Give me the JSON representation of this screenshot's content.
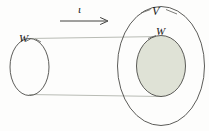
{
  "figure": {
    "type": "set-map-diagram",
    "background_color": "#fdfdfc",
    "stroke_color": "#4a4a46",
    "guide_line_color": "#b9bcb5",
    "fill_color": "#dfe2d6",
    "labels": {
      "source_set": "W",
      "target_superset": "V",
      "target_subset": "W",
      "map_arrow": "ι"
    },
    "elements": [
      {
        "name": "source-oval",
        "label": "W",
        "filled": false,
        "cx": 29.5,
        "cy": 67,
        "rx": 19.5,
        "ry": 28.5
      },
      {
        "name": "target-outer-oval",
        "label": "V",
        "filled": false,
        "cx": 161,
        "cy": 66,
        "rx": 44,
        "ry": 60
      },
      {
        "name": "target-inner-oval",
        "label": "W",
        "filled": true,
        "cx": 161,
        "cy": 66,
        "rx": 25,
        "ry": 31
      },
      {
        "name": "guide-line-top",
        "x1": 30,
        "y1": 38,
        "x2": 161,
        "y2": 36
      },
      {
        "name": "guide-line-bottom",
        "x1": 30,
        "y1": 94,
        "x2": 161,
        "y2": 96
      },
      {
        "name": "map-arrow",
        "label": "ι",
        "x1": 60,
        "y1": 21,
        "x2": 108,
        "y2": 21
      }
    ]
  }
}
